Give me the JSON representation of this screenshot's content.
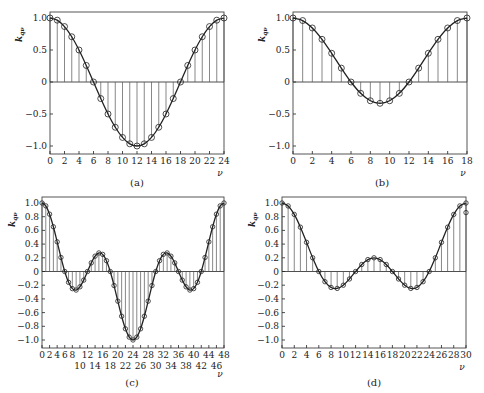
{
  "chart_data": [
    {
      "type": "line",
      "panel": "a",
      "caption": "(a)",
      "title": "",
      "xlabel": "ν",
      "ylabel": "k_qν",
      "xlim": [
        0,
        24
      ],
      "ylim": [
        -1.1,
        1.1
      ],
      "xticks": [
        0,
        2,
        4,
        6,
        8,
        10,
        12,
        14,
        16,
        18,
        20,
        22,
        24
      ],
      "xticks_row2": [],
      "yticks": [
        1.0,
        0.5,
        0,
        -0.5,
        -1.0
      ],
      "ytick_labels": [
        "1.0",
        "0.5",
        "0",
        "-0.5",
        "-1.0"
      ],
      "grid": false,
      "stems": true,
      "frame": {
        "x": 50,
        "y": 12,
        "w": 174,
        "h": 142
      },
      "x": [
        0,
        1,
        2,
        3,
        4,
        5,
        6,
        7,
        8,
        9,
        10,
        11,
        12,
        13,
        14,
        15,
        16,
        17,
        18,
        19,
        20,
        21,
        22,
        23,
        24
      ],
      "values": [
        1,
        0.966,
        0.866,
        0.707,
        0.5,
        0.259,
        0,
        -0.259,
        -0.5,
        -0.707,
        -0.866,
        -0.966,
        -1,
        -0.966,
        -0.866,
        -0.707,
        -0.5,
        -0.259,
        0,
        0.259,
        0.5,
        0.707,
        0.866,
        0.966,
        1
      ]
    },
    {
      "type": "line",
      "panel": "b",
      "caption": "(b)",
      "title": "",
      "xlabel": "ν",
      "ylabel": "k_qν",
      "xlim": [
        0,
        18
      ],
      "ylim": [
        -1.1,
        1.1
      ],
      "xticks": [
        0,
        2,
        4,
        6,
        8,
        10,
        12,
        14,
        16,
        18
      ],
      "xticks_row2": [],
      "yticks": [
        1.0,
        0.5,
        0,
        -0.5,
        -1.0
      ],
      "ytick_labels": [
        "1.0",
        "0.5",
        "0",
        "-0.5",
        "-1.0"
      ],
      "grid": false,
      "stems": true,
      "frame": {
        "x": 293,
        "y": 12,
        "w": 174,
        "h": 142
      },
      "x": [
        0,
        1,
        2,
        3,
        4,
        5,
        6,
        7,
        8,
        9,
        10,
        11,
        12,
        13,
        14,
        15,
        16,
        17,
        18
      ],
      "values": [
        1,
        0.96,
        0.844,
        0.667,
        0.449,
        0.217,
        0,
        -0.177,
        -0.293,
        -0.333,
        -0.293,
        -0.177,
        0,
        0.217,
        0.449,
        0.667,
        0.844,
        0.96,
        1
      ]
    },
    {
      "type": "line",
      "panel": "c",
      "caption": "(c)",
      "title": "",
      "xlabel": "ν",
      "ylabel": "k_qν",
      "xlim": [
        0,
        48
      ],
      "ylim": [
        -1.1,
        1.1
      ],
      "xticks": [
        0,
        2,
        4,
        6,
        8,
        12,
        16,
        20,
        24,
        28,
        32,
        36,
        40,
        44,
        48
      ],
      "xticks_row2": [
        10,
        14,
        18,
        22,
        26,
        30,
        34,
        38,
        42,
        46
      ],
      "yticks": [
        1.0,
        0.8,
        0.6,
        0.4,
        0.2,
        0,
        -0.2,
        -0.4,
        -0.6,
        -0.8,
        -1.0
      ],
      "ytick_labels": [
        "1.0",
        "0.8",
        "0.6",
        "0.4",
        "0.2",
        "0",
        "-0.2",
        "-0.4",
        "-0.6",
        "-0.8",
        "-1.0"
      ],
      "grid": false,
      "stems": true,
      "frame": {
        "x": 42,
        "y": 197,
        "w": 182,
        "h": 151
      },
      "x": [
        0,
        1,
        2,
        3,
        4,
        5,
        6,
        7,
        8,
        9,
        10,
        11,
        12,
        13,
        14,
        15,
        16,
        17,
        18,
        19,
        20,
        21,
        22,
        23,
        24,
        25,
        26,
        27,
        28,
        29,
        30,
        31,
        32,
        33,
        34,
        35,
        36,
        37,
        38,
        39,
        40,
        41,
        42,
        43,
        44,
        45,
        46,
        47,
        48
      ],
      "values": [
        1,
        0.958,
        0.837,
        0.653,
        0.433,
        0.205,
        0,
        -0.158,
        -0.25,
        -0.271,
        -0.224,
        -0.126,
        0,
        0.126,
        0.224,
        0.271,
        0.25,
        0.158,
        0,
        -0.205,
        -0.433,
        -0.653,
        -0.837,
        -0.958,
        -1,
        -0.958,
        -0.837,
        -0.653,
        -0.433,
        -0.205,
        0,
        0.158,
        0.25,
        0.271,
        0.224,
        0.126,
        0,
        -0.126,
        -0.224,
        -0.271,
        -0.25,
        -0.158,
        0,
        0.205,
        0.433,
        0.653,
        0.837,
        0.958,
        1
      ]
    },
    {
      "type": "line",
      "panel": "d",
      "caption": "(d)",
      "title": "",
      "xlabel": "ν",
      "ylabel": "k_qν",
      "xlim": [
        0,
        30
      ],
      "ylim": [
        -1.1,
        1.1
      ],
      "xticks": [
        0,
        2,
        4,
        6,
        8,
        10,
        12,
        14,
        16,
        18,
        20,
        22,
        24,
        26,
        28,
        30
      ],
      "xticks_row2": [],
      "yticks": [
        1.0,
        0.8,
        0.6,
        0.4,
        0.2,
        0,
        -0.2,
        -0.4,
        -0.6,
        -0.8,
        -1.0
      ],
      "ytick_labels": [
        "1.0",
        "0.8",
        "0.6",
        "0.4",
        "0.2",
        "0",
        "-0.2",
        "-0.4",
        "-0.6",
        "-0.8",
        "-1.0"
      ],
      "grid": false,
      "stems": true,
      "frame": {
        "x": 282,
        "y": 197,
        "w": 184,
        "h": 151
      },
      "x": [
        0,
        1,
        2,
        3,
        4,
        5,
        6,
        7,
        8,
        9,
        10,
        11,
        12,
        13,
        14,
        15,
        16,
        17,
        18,
        19,
        20,
        21,
        22,
        23,
        24,
        25,
        26,
        27,
        28,
        29,
        30
      ],
      "values": [
        1,
        0.957,
        0.833,
        0.647,
        0.426,
        0.2,
        0,
        -0.149,
        -0.233,
        -0.247,
        -0.2,
        -0.109,
        0,
        0.102,
        0.174,
        0.2,
        0.174,
        0.102,
        0,
        -0.109,
        -0.2,
        -0.247,
        -0.233,
        -0.149,
        0,
        0.2,
        0.426,
        0.647,
        0.833,
        0.957,
        1
      ],
      "extra_marker": {
        "x": 30,
        "y": 0.86
      }
    }
  ],
  "captions": {
    "a": "(a)",
    "b": "(b)",
    "c": "(c)",
    "d": "(d)"
  },
  "colors": {
    "ink": "#222222",
    "stem": "#555555",
    "frame": "#444444",
    "background": "#ffffff"
  }
}
